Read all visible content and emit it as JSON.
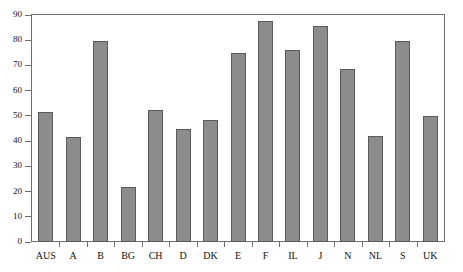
{
  "chart_data": {
    "type": "bar",
    "title": "",
    "xlabel": "",
    "ylabel": "",
    "ylim": [
      0,
      90
    ],
    "yticks": [
      0,
      10,
      20,
      30,
      40,
      50,
      60,
      70,
      80,
      90
    ],
    "grid": false,
    "legend": false,
    "bar_color": "#8c8c8c",
    "bar_edge_color": "#5a5a5a",
    "frame_color": "#6f6f6f",
    "categories": [
      "AUS",
      "A",
      "B",
      "BG",
      "CH",
      "D",
      "DK",
      "E",
      "F",
      "IL",
      "J",
      "N",
      "NL",
      "S",
      "UK"
    ],
    "values": [
      51.5,
      41.5,
      79.5,
      22,
      52.5,
      45,
      48.5,
      75,
      87.5,
      76,
      85.5,
      68.5,
      42,
      79.5,
      50
    ]
  }
}
